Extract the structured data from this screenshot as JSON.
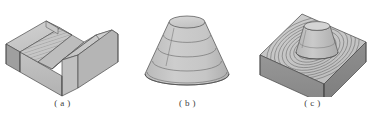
{
  "page": {
    "background_color": "#ffffff",
    "width": 376,
    "height": 119
  },
  "palette": {
    "top_face": "#c9c9c9",
    "front_face": "#b8b8b8",
    "side_face_dark": "#8d8d8d",
    "groove_face": "#c2c2c2",
    "outline": "#4a4a4a",
    "contour_line": "#6d6d6d",
    "caption_text": "#3b3b3b"
  },
  "figures": [
    {
      "id": "v-block",
      "caption": "( a )",
      "label_letter": "a",
      "description": "Isometric V-groove block with hatched angled walls",
      "shading": "light-gray",
      "hatch_lines": 26
    },
    {
      "id": "stepped-cone",
      "caption": "( b )",
      "label_letter": "b",
      "description": "Truncated cone with stepped horizontal contour rings",
      "shading": "light-gray",
      "contour_rings": 5
    },
    {
      "id": "contoured-base-with-boss",
      "caption": "( c )",
      "label_letter": "c",
      "description": "Rectangular base with concentric toolpath contours and truncated cone boss",
      "shading": "two-tone-gray",
      "contour_rings": 11
    }
  ]
}
